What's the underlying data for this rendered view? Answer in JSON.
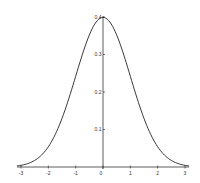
{
  "chart_data": {
    "type": "line",
    "title": "",
    "xlabel": "",
    "ylabel": "",
    "x_ticks": [
      -3,
      -2,
      -1,
      0,
      1,
      2,
      3
    ],
    "y_ticks": [
      0.1,
      0.2,
      0.3,
      0.4
    ],
    "x_tick_labels": [
      "-3",
      "-2",
      "-1",
      "0",
      "1",
      "2",
      "3"
    ],
    "y_tick_labels": [
      "0.1",
      "0.2",
      "0.3",
      "0.4"
    ],
    "xlim": [
      -3,
      3
    ],
    "ylim": [
      0,
      0.4
    ],
    "grid": false,
    "legend": null,
    "series": [
      {
        "name": "N(0,1) density",
        "x": [
          -3,
          -2.5,
          -2,
          -1.5,
          -1,
          -0.5,
          0,
          0.5,
          1,
          1.5,
          2,
          2.5,
          3
        ],
        "y": [
          0.0044,
          0.0175,
          0.054,
          0.1295,
          0.242,
          0.3521,
          0.3989,
          0.3521,
          0.242,
          0.1295,
          0.054,
          0.0175,
          0.0044
        ]
      }
    ]
  },
  "style": {
    "line_color": "#222222",
    "axis_color": "#333333",
    "background": "#ffffff"
  }
}
